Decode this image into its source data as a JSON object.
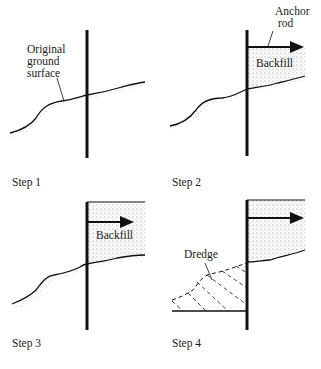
{
  "figure": {
    "panels": [
      {
        "step_label": "Step 1",
        "annotations": {
          "ground_line1": "Original",
          "ground_line2": "ground",
          "ground_line3": "surface"
        }
      },
      {
        "step_label": "Step 2",
        "annotations": {
          "anchor_line1": "Anchor",
          "anchor_line2": "rod",
          "backfill": "Backfill"
        }
      },
      {
        "step_label": "Step 3",
        "annotations": {
          "backfill": "Backfill"
        }
      },
      {
        "step_label": "Step 4",
        "annotations": {
          "dredge": "Dredge"
        }
      }
    ],
    "colors": {
      "line": "#111111",
      "stipple": "#8a8a8a",
      "background": "#ffffff"
    }
  }
}
